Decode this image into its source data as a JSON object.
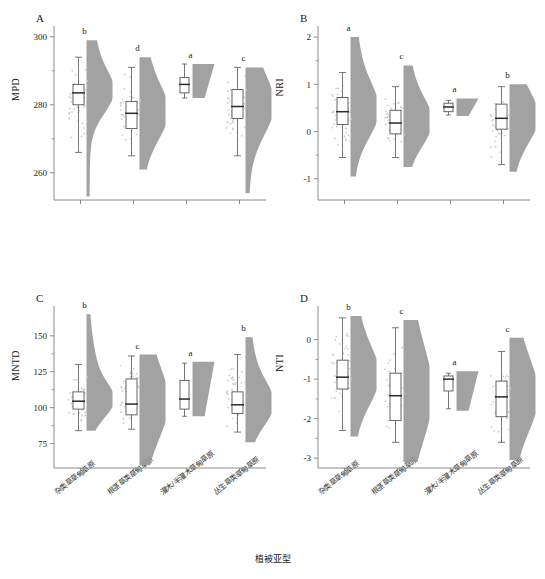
{
  "figure": {
    "xaxis_title": "植被亚型",
    "groups": [
      {
        "id": "g1",
        "label": "杂类草草甸草原"
      },
      {
        "id": "g2",
        "label": "根茎草类草甸草原"
      },
      {
        "id": "g3",
        "label": "灌木/半灌木草甸草原"
      },
      {
        "id": "g4",
        "label": "丛生草类草甸草原"
      }
    ],
    "colors": {
      "violin_fill": "#9a9a9a",
      "box_fill": "#ffffff",
      "box_stroke": "#555555",
      "point": "#c8c8c8",
      "axis": "#8a8a8a",
      "text": "#222222"
    }
  },
  "chart_data": [
    {
      "type": "boxplot",
      "panel": "A",
      "title": "A",
      "xlabel": "植被亚型",
      "ylabel": "MPD",
      "ylim": [
        252,
        302
      ],
      "yticks": [
        260,
        280,
        300
      ],
      "ytick_labels": [
        "260",
        "280",
        "300"
      ],
      "grid": false,
      "legend": "none",
      "categories": [
        "杂类草草甸草原",
        "根茎草类草甸草原",
        "灌木/半灌木草甸草原",
        "丛生草类草甸草原"
      ],
      "sig_letters": [
        "b",
        "d",
        "a",
        "c"
      ],
      "boxes": [
        {
          "group": "杂类草草甸草原",
          "min": 266.0,
          "q1": 280.0,
          "median": 283.5,
          "q3": 286.0,
          "max": 294.0,
          "violin_top": 299.0,
          "violin_bottom": 253.0,
          "n": "large"
        },
        {
          "group": "根茎草类草甸草原",
          "min": 265.0,
          "q1": 273.0,
          "median": 277.5,
          "q3": 281.0,
          "max": 291.0,
          "violin_top": 294.0,
          "violin_bottom": 261.0,
          "n": "large"
        },
        {
          "group": "灌木/半灌木草甸草原",
          "min": 282.0,
          "q1": 283.5,
          "median": 286.0,
          "q3": 288.0,
          "max": 292.0,
          "violin_top": 292.0,
          "violin_bottom": 282.0,
          "n": "small"
        },
        {
          "group": "丛生草类草甸草原",
          "min": 265.0,
          "q1": 276.0,
          "median": 279.5,
          "q3": 284.5,
          "max": 291.0,
          "violin_top": 291.0,
          "violin_bottom": 254.0,
          "n": "large"
        }
      ]
    },
    {
      "type": "boxplot",
      "panel": "B",
      "title": "B",
      "xlabel": "植被亚型",
      "ylabel": "NRI",
      "ylim": [
        -1.45,
        2.15
      ],
      "yticks": [
        -1,
        0,
        1,
        2
      ],
      "ytick_labels": [
        "-1",
        "0",
        "1",
        "2"
      ],
      "grid": false,
      "legend": "none",
      "categories": [
        "杂类草草甸草原",
        "根茎草类草甸草原",
        "灌木/半灌木草甸草原",
        "丛生草类草甸草原"
      ],
      "sig_letters": [
        "a",
        "c",
        "a",
        "b"
      ],
      "boxes": [
        {
          "group": "杂类草草甸草原",
          "min": -0.55,
          "q1": 0.15,
          "median": 0.42,
          "q3": 0.72,
          "max": 1.25,
          "violin_top": 2.0,
          "violin_bottom": -0.95,
          "n": "large"
        },
        {
          "group": "根茎草类草甸草原",
          "min": -0.55,
          "q1": -0.05,
          "median": 0.18,
          "q3": 0.45,
          "max": 0.95,
          "violin_top": 1.4,
          "violin_bottom": -0.75,
          "n": "large"
        },
        {
          "group": "灌木/半灌木草甸草原",
          "min": 0.35,
          "q1": 0.42,
          "median": 0.52,
          "q3": 0.6,
          "max": 0.66,
          "violin_top": 0.7,
          "violin_bottom": 0.33,
          "n": "small"
        },
        {
          "group": "丛生草类草甸草原",
          "min": -0.7,
          "q1": 0.05,
          "median": 0.28,
          "q3": 0.58,
          "max": 0.95,
          "violin_top": 1.0,
          "violin_bottom": -0.85,
          "n": "large"
        }
      ]
    },
    {
      "type": "boxplot",
      "panel": "C",
      "title": "C",
      "xlabel": "植被亚型",
      "ylabel": "MNTD",
      "ylim": [
        58,
        168
      ],
      "yticks": [
        75,
        100,
        125,
        150
      ],
      "ytick_labels": [
        "75",
        "100",
        "125",
        "150"
      ],
      "grid": false,
      "legend": "none",
      "categories": [
        "杂类草草甸草原",
        "根茎草类草甸草原",
        "灌木/半灌木草甸草原",
        "丛生草类草甸草原"
      ],
      "sig_letters": [
        "b",
        "c",
        "a",
        "b"
      ],
      "boxes": [
        {
          "group": "杂类草草甸草原",
          "min": 84.0,
          "q1": 99.0,
          "median": 104.5,
          "q3": 111.0,
          "max": 130.0,
          "violin_top": 165.0,
          "violin_bottom": 84.0,
          "n": "large"
        },
        {
          "group": "根茎草类草甸草原",
          "min": 85.0,
          "q1": 95.0,
          "median": 102.5,
          "q3": 120.0,
          "max": 136.0,
          "violin_top": 137.0,
          "violin_bottom": 60.0,
          "n": "large"
        },
        {
          "group": "灌木/半灌木草甸草原",
          "min": 94.0,
          "q1": 99.0,
          "median": 106.0,
          "q3": 119.0,
          "max": 131.0,
          "violin_top": 132.0,
          "violin_bottom": 94.0,
          "n": "small"
        },
        {
          "group": "丛生草类草甸草原",
          "min": 83.0,
          "q1": 96.0,
          "median": 102.0,
          "q3": 111.0,
          "max": 137.0,
          "violin_top": 149.0,
          "violin_bottom": 76.0,
          "n": "large"
        }
      ]
    },
    {
      "type": "boxplot",
      "panel": "D",
      "title": "D",
      "xlabel": "植被亚型",
      "ylabel": "NTI",
      "ylim": [
        -3.25,
        0.75
      ],
      "yticks": [
        -3,
        -2,
        -1,
        0
      ],
      "ytick_labels": [
        "-3",
        "-2",
        "-1",
        "0"
      ],
      "grid": false,
      "legend": "none",
      "categories": [
        "杂类草草甸草原",
        "根茎草类草甸草原",
        "灌木/半灌木草甸草原",
        "丛生草类草甸草原"
      ],
      "sig_letters": [
        "b",
        "c",
        "a",
        "c"
      ],
      "boxes": [
        {
          "group": "杂类草草甸草原",
          "min": -2.3,
          "q1": -1.25,
          "median": -0.95,
          "q3": -0.52,
          "max": 0.55,
          "violin_top": 0.6,
          "violin_bottom": -2.45,
          "n": "large"
        },
        {
          "group": "根茎草类草甸草原",
          "min": -2.6,
          "q1": -2.05,
          "median": -1.42,
          "q3": -0.85,
          "max": 0.3,
          "violin_top": 0.5,
          "violin_bottom": -3.1,
          "n": "large"
        },
        {
          "group": "灌木/半灌木草甸草原",
          "min": -1.75,
          "q1": -1.3,
          "median": -1.0,
          "q3": -0.92,
          "max": -0.85,
          "violin_top": -0.8,
          "violin_bottom": -1.8,
          "n": "small"
        },
        {
          "group": "丛生草类草甸草原",
          "min": -2.6,
          "q1": -1.95,
          "median": -1.45,
          "q3": -1.05,
          "max": -0.3,
          "violin_top": 0.05,
          "violin_bottom": -3.05,
          "n": "large"
        }
      ]
    }
  ]
}
